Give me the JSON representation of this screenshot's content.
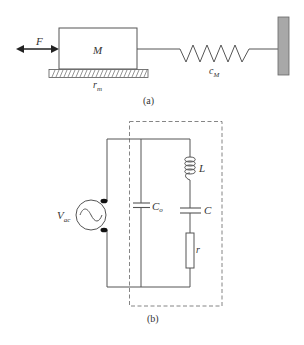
{
  "panel_a": {
    "caption": "(a)",
    "force_label": "F",
    "mass_label": "M",
    "damping_label": "r",
    "damping_sub": "m",
    "spring_label": "c",
    "spring_sub": "M"
  },
  "panel_b": {
    "caption": "(b)",
    "source_label": "V",
    "source_sub": "ac",
    "parallel_cap_label": "C",
    "parallel_cap_sub": "o",
    "inductor_label": "L",
    "series_cap_label": "C",
    "resistor_label": "r"
  },
  "colors": {
    "line": "#555555",
    "wall_fill": "#a8a8a8",
    "dashed": "#777777"
  }
}
